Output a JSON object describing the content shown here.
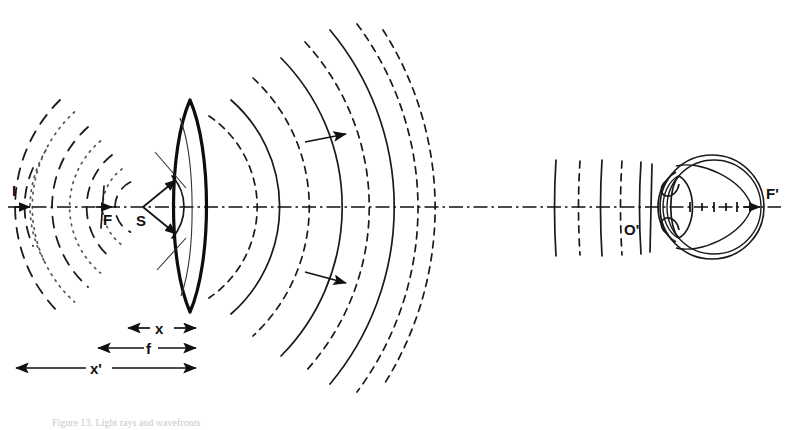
{
  "figure": {
    "domain": "Diagram",
    "caption": "Figure 13. Light rays and wavefronts",
    "background_color": "#ffffff",
    "ink_color": "#111111",
    "width": 789,
    "height": 430
  },
  "labels": {
    "incident_ray": "I",
    "front_focal_point": "F",
    "source_point": "S",
    "eye_principal_point": "O'",
    "eye_focal_point": "F'",
    "object_distance": "x",
    "focal_length": "f",
    "image_distance": "x'"
  },
  "optical_axis": {
    "y": 207,
    "x_start": 8,
    "x_end": 781,
    "style": "dash-dot"
  },
  "lens": {
    "center_x": 190,
    "top_y": 100,
    "bottom_y": 312,
    "type": "biconvex",
    "edge_bulge": 16
  },
  "source": {
    "label": "S",
    "x": 143,
    "y": 207,
    "label_x": 139,
    "label_y": 222
  },
  "focal_point": {
    "label": "F",
    "x": 104,
    "y": 207,
    "label_x": 99,
    "label_y": 222
  },
  "incident_marker": {
    "label": "I",
    "x": 16,
    "label_y": 193,
    "arrow_y": 207
  },
  "eye": {
    "center_x": 712,
    "center_y": 207,
    "radius": 52,
    "principal_point_label": "O'",
    "principal_point_x": 634,
    "principal_point_label_x": 626,
    "principal_point_label_y": 232,
    "focal_point_label": "F'",
    "focal_point_x": 762,
    "focal_point_label_x": 767,
    "focal_point_label_y": 198
  },
  "diverging_wavefronts": {
    "description": "Spherical wavefronts diverging from source S, drawn alternately dashed and dotted",
    "center_x": 143,
    "center_y": 207,
    "radii": [
      28,
      47,
      66,
      86,
      107,
      128,
      150
    ],
    "styles": [
      "dashed",
      "dotted",
      "dashed",
      "dotted",
      "dashed",
      "dotted",
      "dashed"
    ]
  },
  "converging_wavefronts": {
    "description": "Spherical wavefronts converging toward the image, drawn alternately solid and dashed, expanding to the right of the lens",
    "center_x": 143,
    "center_y": 207,
    "radii": [
      70,
      97,
      124,
      152,
      181,
      212,
      244
    ],
    "styles": [
      "solid",
      "dashed",
      "solid",
      "dashed",
      "solid",
      "dashed",
      "solid"
    ]
  },
  "plane_wavefronts": {
    "description": "Nearly plane wavefronts arriving at the eye, alternating solid and dashed",
    "x_positions": [
      556,
      580,
      602,
      622,
      640
    ],
    "styles": [
      "solid",
      "dashed",
      "solid",
      "dashed",
      "solid"
    ],
    "half_height": 48
  },
  "propagation_arrows": [
    {
      "x1": 305,
      "y1": 142,
      "x2": 348,
      "y2": 134,
      "direction": "right"
    },
    {
      "x1": 305,
      "y1": 272,
      "x2": 348,
      "y2": 283,
      "direction": "right"
    }
  ],
  "source_cone": {
    "description": "Cone of rays emitted from S toward the lens aperture, with arrowheads on the marginal rays",
    "apex_x": 143,
    "apex_y": 207,
    "upper_end_x": 180,
    "upper_end_y": 178,
    "lower_end_x": 180,
    "lower_end_y": 237
  },
  "dimensions": [
    {
      "key": "x",
      "label": "x",
      "y": 328,
      "x_left": 126,
      "x_right": 196,
      "label_x": 161,
      "arrows": "both"
    },
    {
      "key": "f",
      "label": "f",
      "y": 348,
      "x_left": 96,
      "x_right": 196,
      "label_x": 150,
      "arrows": "both"
    },
    {
      "key": "x_prime",
      "label": "x'",
      "y": 368,
      "x_left": 14,
      "x_right": 196,
      "label_x": 97,
      "arrows": "both"
    }
  ],
  "eye_axis_ticks": {
    "description": "Small tick marks along the optical axis inside the eyeball",
    "x_positions": [
      690,
      700,
      710,
      720,
      730,
      740,
      750
    ],
    "half_height": 5
  }
}
